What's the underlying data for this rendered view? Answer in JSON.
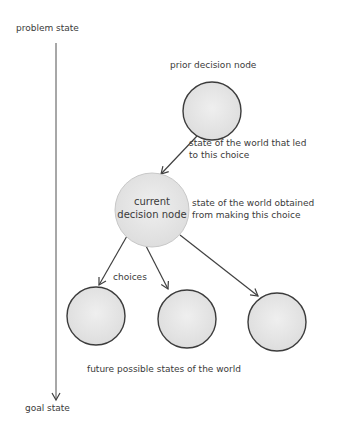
{
  "axis": {
    "top_label": "problem state",
    "bottom_label": "goal state"
  },
  "nodes": {
    "prior": {
      "label": "prior decision node"
    },
    "current": {
      "line1": "current",
      "line2": "decision node"
    },
    "future_count": 3
  },
  "annotations": {
    "prior_state": "state of the world that led to this choice",
    "current_state": "state of the world obtained from making this choice",
    "choices": "choices",
    "future_states": "future possible states of the world"
  },
  "colors": {
    "node_fill": "#e6e6e6",
    "node_stroke": "#3c3c3c",
    "line": "#404040",
    "text": "#3a3a3a"
  }
}
